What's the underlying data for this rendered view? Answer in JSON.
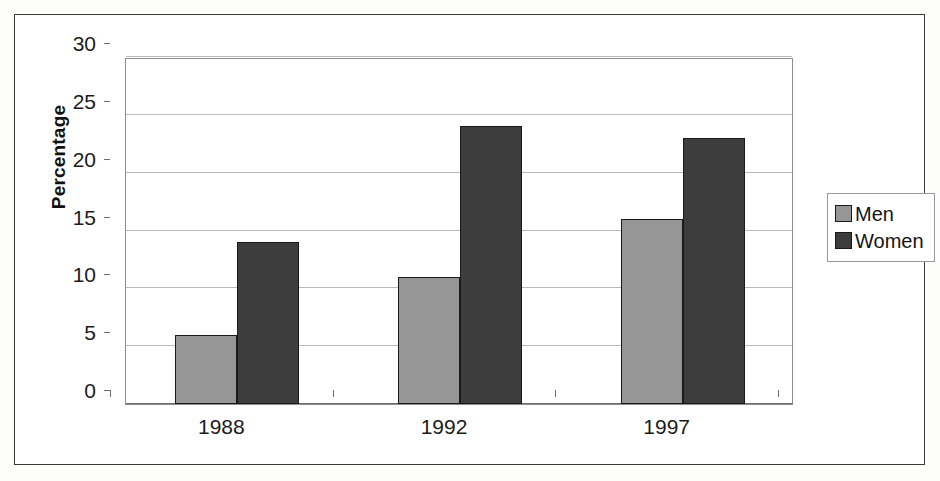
{
  "chart_data": {
    "type": "bar",
    "title": "",
    "subtitle": "",
    "xlabel": "",
    "ylabel": "Percentage",
    "categories": [
      "1988",
      "1992",
      "1997"
    ],
    "series": [
      {
        "name": "Men",
        "values": [
          6,
          11,
          16
        ],
        "color": "#969696"
      },
      {
        "name": "Women",
        "values": [
          14,
          24,
          23
        ],
        "color": "#3d3d3d"
      }
    ],
    "ylim": [
      0,
      30
    ],
    "yticks": [
      0,
      5,
      10,
      15,
      20,
      25,
      30
    ],
    "ytick_labels": [
      "0",
      "5",
      "10",
      "15",
      "20",
      "25",
      "30"
    ],
    "grid": true,
    "legend_position": "right",
    "legend_entries": [
      "Men",
      "Women"
    ],
    "annotations": []
  },
  "legend": {
    "items": [
      {
        "label": "Men"
      },
      {
        "label": "Women"
      }
    ]
  }
}
